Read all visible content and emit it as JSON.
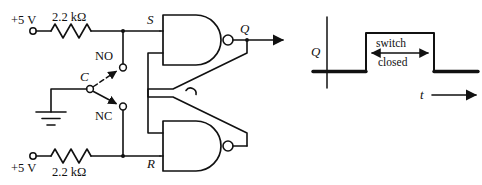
{
  "figure": {
    "kind": "circuit-schematic-with-timing-diagram",
    "line_color": "#111111",
    "background_color": "#ffffff"
  },
  "circuit": {
    "supplies": [
      {
        "id": "top",
        "label": "+5 V"
      },
      {
        "id": "bottom",
        "label": "+5 V"
      }
    ],
    "resistors": [
      {
        "id": "r-top",
        "label": "2.2 kΩ",
        "value": 2.2,
        "unit": "kΩ"
      },
      {
        "id": "r-bottom",
        "label": "2.2 kΩ",
        "value": 2.2,
        "unit": "kΩ"
      }
    ],
    "switch": {
      "type": "SPDT",
      "common_label": "C",
      "normally_open_label": "NO",
      "normally_closed_label": "NC",
      "common_tied_to": "ground"
    },
    "ground": {
      "label": ""
    },
    "nodes": [
      {
        "id": "set",
        "label": "S"
      },
      {
        "id": "reset",
        "label": "R"
      }
    ],
    "gates": [
      {
        "id": "nand-top",
        "type": "NAND",
        "output_label": "Q"
      },
      {
        "id": "nand-bottom",
        "type": "NAND",
        "output_label": ""
      }
    ],
    "outputs": [
      {
        "id": "q-out",
        "label": "Q"
      }
    ]
  },
  "timing": {
    "y_axis_label": "Q",
    "x_axis_label": "t",
    "annotation_line1": "switch",
    "annotation_line2": "closed",
    "waveform": {
      "low_level": 0,
      "high_level": 1,
      "transitions": [
        {
          "t": 0.38,
          "to": 1
        },
        {
          "t": 0.76,
          "to": 0
        }
      ]
    }
  }
}
